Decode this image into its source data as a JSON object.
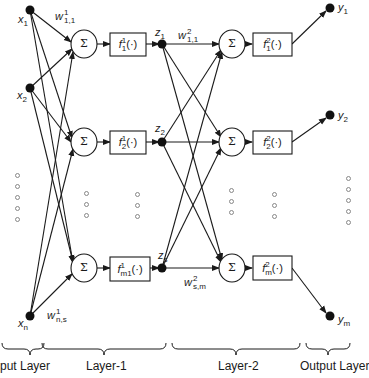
{
  "diagram": {
    "type": "two-layer feedforward neural network",
    "inputs": [
      {
        "name": "x",
        "sub": "1"
      },
      {
        "name": "x",
        "sub": "2"
      },
      {
        "name": "x",
        "sub": "n"
      }
    ],
    "weights_layer1": {
      "first": {
        "name": "w",
        "sup": "1",
        "sub": "1,1"
      },
      "last": {
        "name": "w",
        "sup": "1",
        "sub": "n,s"
      }
    },
    "summation_symbol": "Σ",
    "layer1_activations": [
      {
        "name": "f",
        "sup": "1",
        "sub": "1",
        "arg": "(·)"
      },
      {
        "name": "f",
        "sup": "1",
        "sub": "2",
        "arg": "(·)"
      },
      {
        "name": "f",
        "sup": "1",
        "sub": "m1",
        "arg": "(·)"
      }
    ],
    "hidden_outputs": [
      {
        "name": "z",
        "sub": "1"
      },
      {
        "name": "z",
        "sub": "2"
      },
      {
        "name": "z",
        "sub": "s"
      }
    ],
    "weights_layer2": {
      "first": {
        "name": "w",
        "sup": "2",
        "sub": "1,1"
      },
      "last": {
        "name": "w",
        "sup": "2",
        "sub": "s,m"
      }
    },
    "layer2_activations": [
      {
        "name": "f",
        "sup": "2",
        "sub": "1",
        "arg": "(·)"
      },
      {
        "name": "f",
        "sup": "2",
        "sub": "2",
        "arg": "(·)"
      },
      {
        "name": "f",
        "sup": "2",
        "sub": "m",
        "arg": "(·)"
      }
    ],
    "outputs": [
      {
        "name": "y",
        "sub": "1"
      },
      {
        "name": "y",
        "sub": "2"
      },
      {
        "name": "y",
        "sub": "m"
      }
    ],
    "layer_labels": [
      "Input Layer",
      "Layer-1",
      "Layer-2",
      "Output Layer"
    ],
    "colors": {
      "stroke": "#1a1a1a",
      "node": "#111111",
      "ellipsis": "#888888"
    }
  }
}
